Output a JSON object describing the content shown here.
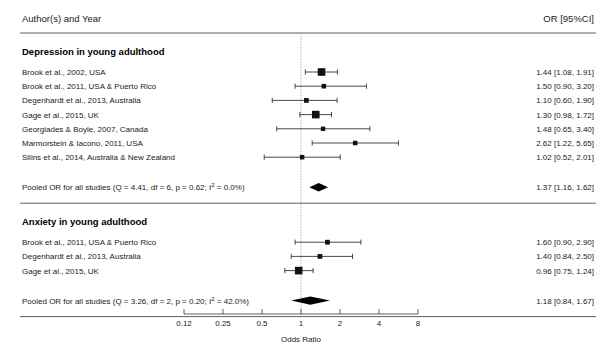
{
  "header": {
    "author_column": "Author(s) and Year",
    "or_column": "OR [95%CI]"
  },
  "axis": {
    "title": "Odds Ratio",
    "scale": "log2",
    "ticks": [
      "0.12",
      "0.25",
      "0.5",
      "1",
      "2",
      "4",
      "8"
    ],
    "tick_values": [
      0.125,
      0.25,
      0.5,
      1,
      2,
      4,
      8
    ],
    "reference_value": 1
  },
  "colors": {
    "marker": "#111111",
    "diamond": "#000000",
    "ci_line": "#333333",
    "rule": "#4d4d4d",
    "reference_line": "#9a9a9a",
    "text": "#1a1a1a",
    "background": "#ffffff"
  },
  "groups": [
    {
      "title": "Depression in young adulthood",
      "studies": [
        {
          "label": "Brook et al., 2002, USA",
          "or": 1.44,
          "lower": 1.08,
          "upper": 1.91,
          "weight": 1.0,
          "or_text": "1.44 [1.08, 1.91]"
        },
        {
          "label": "Brook et al., 2011, USA & Puerto Rico",
          "or": 1.5,
          "lower": 0.9,
          "upper": 3.2,
          "weight": 0.42,
          "or_text": "1.50 [0.90, 3.20]"
        },
        {
          "label": "Degenhardt et al., 2013, Australia",
          "or": 1.1,
          "lower": 0.6,
          "upper": 1.9,
          "weight": 0.45,
          "or_text": "1.10 [0.60, 1.90]"
        },
        {
          "label": "Gage et al., 2015, UK",
          "or": 1.3,
          "lower": 0.98,
          "upper": 1.72,
          "weight": 1.0,
          "or_text": "1.30 [0.98, 1.72]"
        },
        {
          "label": "Georgiades & Boyle, 2007, Canada",
          "or": 1.48,
          "lower": 0.65,
          "upper": 3.4,
          "weight": 0.38,
          "or_text": "1.48 [0.65, 3.40]"
        },
        {
          "label": "Marmorstein & Iacono, 2011, USA",
          "or": 2.62,
          "lower": 1.22,
          "upper": 5.65,
          "weight": 0.4,
          "or_text": "2.62 [1.22, 5.65]"
        },
        {
          "label": "Silins et al., 2014, Australia & New Zealand",
          "or": 1.02,
          "lower": 0.52,
          "upper": 2.01,
          "weight": 0.4,
          "or_text": "1.02 [0.52, 2.01]"
        }
      ],
      "pooled": {
        "label_prefix": "Pooled OR for all studies (Q = 4.41, df = 6, p = 0.62; I",
        "label_sup": "2",
        "label_suffix": " = 0.0%)",
        "label_plain": "Pooled OR for all studies (Q = 4.41, df = 6, p = 0.62; I2 = 0.0%)",
        "or": 1.37,
        "lower": 1.16,
        "upper": 1.62,
        "or_text": "1.37 [1.16, 1.62]",
        "statistics": {
          "Q": 4.41,
          "df": 6,
          "p": 0.62,
          "I2": "0.0%"
        }
      }
    },
    {
      "title": "Anxiety in young adulthood",
      "studies": [
        {
          "label": "Brook et al., 2011, USA & Puerto Rico",
          "or": 1.6,
          "lower": 0.9,
          "upper": 2.9,
          "weight": 0.45,
          "or_text": "1.60 [0.90, 2.90]"
        },
        {
          "label": "Degenhardt et al., 2013, Australia",
          "or": 1.4,
          "lower": 0.84,
          "upper": 2.5,
          "weight": 0.45,
          "or_text": "1.40 [0.84, 2.50]"
        },
        {
          "label": "Gage et al., 2015, UK",
          "or": 0.96,
          "lower": 0.75,
          "upper": 1.24,
          "weight": 1.0,
          "or_text": "0.96 [0.75, 1.24]"
        }
      ],
      "pooled": {
        "label_prefix": "Pooled OR for all studies (Q = 3.26, df = 2, p = 0.20; I",
        "label_sup": "2",
        "label_suffix": " = 42.0%)",
        "label_plain": "Pooled OR for all studies (Q = 3.26, df = 2, p = 0.20; I2 = 42.0%)",
        "or": 1.18,
        "lower": 0.84,
        "upper": 1.67,
        "or_text": "1.18 [0.84, 1.67]",
        "statistics": {
          "Q": 3.26,
          "df": 2,
          "p": 0.2,
          "I2": "42.0%"
        }
      }
    }
  ],
  "chart_data": {
    "type": "forest",
    "title": "",
    "xlabel": "Odds Ratio",
    "ylabel": "",
    "xscale": "log",
    "xticks": [
      0.125,
      0.25,
      0.5,
      1,
      2,
      4,
      8
    ],
    "xticklabels": [
      "0.12",
      "0.25",
      "0.5",
      "1",
      "2",
      "4",
      "8"
    ],
    "xlim": [
      0.125,
      8
    ],
    "reference_line": 1,
    "grid": false,
    "legend": "none",
    "columns": [
      "Author(s) and Year",
      "OR [95%CI]"
    ],
    "rows": [
      {
        "group": "Depression in young adulthood",
        "study": "Brook et al., 2002, USA",
        "or": 1.44,
        "ci_low": 1.08,
        "ci_high": 1.91
      },
      {
        "group": "Depression in young adulthood",
        "study": "Brook et al., 2011, USA & Puerto Rico",
        "or": 1.5,
        "ci_low": 0.9,
        "ci_high": 3.2
      },
      {
        "group": "Depression in young adulthood",
        "study": "Degenhardt et al., 2013, Australia",
        "or": 1.1,
        "ci_low": 0.6,
        "ci_high": 1.9
      },
      {
        "group": "Depression in young adulthood",
        "study": "Gage et al., 2015, UK",
        "or": 1.3,
        "ci_low": 0.98,
        "ci_high": 1.72
      },
      {
        "group": "Depression in young adulthood",
        "study": "Georgiades & Boyle, 2007, Canada",
        "or": 1.48,
        "ci_low": 0.65,
        "ci_high": 3.4
      },
      {
        "group": "Depression in young adulthood",
        "study": "Marmorstein & Iacono, 2011, USA",
        "or": 2.62,
        "ci_low": 1.22,
        "ci_high": 5.65
      },
      {
        "group": "Depression in young adulthood",
        "study": "Silins et al., 2014, Australia & New Zealand",
        "or": 1.02,
        "ci_low": 0.52,
        "ci_high": 2.01
      },
      {
        "group": "Depression in young adulthood",
        "study": "Pooled OR for all studies",
        "or": 1.37,
        "ci_low": 1.16,
        "ci_high": 1.62,
        "summary": true
      },
      {
        "group": "Anxiety in young adulthood",
        "study": "Brook et al., 2011, USA & Puerto Rico",
        "or": 1.6,
        "ci_low": 0.9,
        "ci_high": 2.9
      },
      {
        "group": "Anxiety in young adulthood",
        "study": "Degenhardt et al., 2013, Australia",
        "or": 1.4,
        "ci_low": 0.84,
        "ci_high": 2.5
      },
      {
        "group": "Anxiety in young adulthood",
        "study": "Gage et al., 2015, UK",
        "or": 0.96,
        "ci_low": 0.75,
        "ci_high": 1.24
      },
      {
        "group": "Anxiety in young adulthood",
        "study": "Pooled OR for all studies",
        "or": 1.18,
        "ci_low": 0.84,
        "ci_high": 1.67,
        "summary": true
      }
    ]
  }
}
